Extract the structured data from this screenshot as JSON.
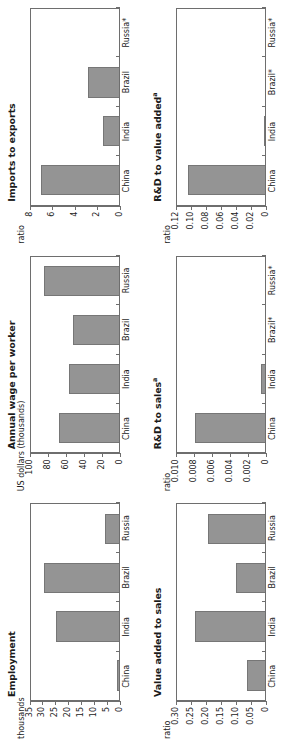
{
  "figure": {
    "bar_color": "#949494",
    "bar_edge_color": "#767676",
    "axis_color": "#6e6e6e",
    "text_color": "#1b1b1b",
    "background": "#ffffff",
    "categories": [
      "China",
      "India",
      "Brazil",
      "Russia"
    ],
    "footnote_marker": "a"
  },
  "chart_data": [
    {
      "type": "bar",
      "id": "employment",
      "title": "Employment",
      "title_sup": "",
      "ylabel": "thousands",
      "xlabel": "",
      "categories": [
        "China",
        "India",
        "Brazil",
        "Russia"
      ],
      "category_labels": [
        "China",
        "India",
        "Brazil",
        "Russia"
      ],
      "category_sups": [
        "",
        "",
        "",
        ""
      ],
      "values": [
        1.0,
        25.0,
        30.0,
        6.0
      ],
      "ylim": [
        0,
        35
      ],
      "yticks": [
        0,
        5,
        10,
        15,
        20,
        25,
        30,
        35
      ],
      "ytick_labels": [
        "0",
        "5",
        "10",
        "15",
        "20",
        "25",
        "30",
        "35"
      ],
      "grid": false,
      "legend": "none"
    },
    {
      "type": "bar",
      "id": "annual-wage-per-worker",
      "title": "Annual wage per worker",
      "title_sup": "",
      "ylabel": "US dollars (thousands)",
      "xlabel": "",
      "categories": [
        "China",
        "India",
        "Brazil",
        "Russia"
      ],
      "category_labels": [
        "China",
        "India",
        "Brazil",
        "Russia"
      ],
      "category_sups": [
        "",
        "",
        "",
        ""
      ],
      "values": [
        68.0,
        57.0,
        53.0,
        85.0
      ],
      "ylim": [
        0,
        100
      ],
      "yticks": [
        0,
        20,
        40,
        60,
        80,
        100
      ],
      "ytick_labels": [
        "0",
        "20",
        "40",
        "60",
        "80",
        "100"
      ],
      "grid": false,
      "legend": "none"
    },
    {
      "type": "bar",
      "id": "imports-to-exports",
      "title": "Imports to exports",
      "title_sup": "",
      "ylabel": "ratio",
      "xlabel": "",
      "categories": [
        "China",
        "India",
        "Brazil",
        "Russia"
      ],
      "category_labels": [
        "China",
        "India",
        "Brazil",
        "Russia*"
      ],
      "category_sups": [
        "",
        "",
        "",
        ""
      ],
      "values": [
        7.1,
        1.5,
        2.9,
        0.0
      ],
      "ylim": [
        0,
        8
      ],
      "yticks": [
        0,
        2,
        4,
        6,
        8
      ],
      "ytick_labels": [
        "0",
        "2",
        "4",
        "6",
        "8"
      ],
      "grid": false,
      "legend": "none"
    },
    {
      "type": "bar",
      "id": "value-added-to-sales",
      "title": "Value added to sales",
      "title_sup": "",
      "ylabel": "ratio",
      "xlabel": "",
      "categories": [
        "China",
        "India",
        "Brazil",
        "Russia"
      ],
      "category_labels": [
        "China",
        "India",
        "Brazil",
        "Russia"
      ],
      "category_sups": [
        "",
        "",
        "",
        ""
      ],
      "values": [
        0.065,
        0.24,
        0.1,
        0.195
      ],
      "ylim": [
        0,
        0.3
      ],
      "yticks": [
        0,
        0.05,
        0.1,
        0.15,
        0.2,
        0.25,
        0.3
      ],
      "ytick_labels": [
        "0",
        "0.05",
        "0.10",
        "0.15",
        "0.20",
        "0.25",
        "0.30"
      ],
      "grid": false,
      "legend": "none"
    },
    {
      "type": "bar",
      "id": "rd-to-sales",
      "title": "R&D to sales",
      "title_sup": "a",
      "ylabel": "ratio",
      "xlabel": "",
      "categories": [
        "China",
        "India",
        "Brazil",
        "Russia"
      ],
      "category_labels": [
        "China",
        "India",
        "Brazil*",
        "Russia*"
      ],
      "category_sups": [
        "",
        "",
        "",
        ""
      ],
      "values": [
        0.008,
        0.0006,
        0.0,
        0.0
      ],
      "ylim": [
        0,
        0.01
      ],
      "yticks": [
        0,
        0.002,
        0.004,
        0.006,
        0.008,
        0.01
      ],
      "ytick_labels": [
        "0",
        "0.002",
        "0.004",
        "0.006",
        "0.008",
        "0.010"
      ],
      "grid": false,
      "legend": "none"
    },
    {
      "type": "bar",
      "id": "rd-to-value-added",
      "title": "R&D to value added",
      "title_sup": "a",
      "ylabel": "ratio",
      "xlabel": "",
      "categories": [
        "China",
        "India",
        "Brazil",
        "Russia"
      ],
      "category_labels": [
        "China",
        "India",
        "Brazil*",
        "Russia*"
      ],
      "category_sups": [
        "",
        "",
        "",
        ""
      ],
      "values": [
        0.105,
        0.002,
        0.0,
        0.0
      ],
      "ylim": [
        0,
        0.12
      ],
      "yticks": [
        0,
        0.02,
        0.04,
        0.06,
        0.08,
        0.1,
        0.12
      ],
      "ytick_labels": [
        "0",
        "0.02",
        "0.04",
        "0.06",
        "0.08",
        "0.10",
        "0.12"
      ],
      "grid": false,
      "legend": "none"
    }
  ]
}
